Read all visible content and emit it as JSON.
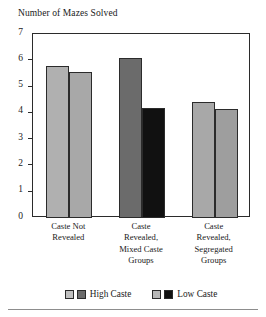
{
  "chart_data": {
    "type": "bar",
    "title": "Number of Mazes Solved",
    "xlabel": "",
    "ylabel": "",
    "ylim": [
      0,
      7
    ],
    "ytick_labels": [
      "7",
      "6",
      "5",
      "4",
      "3",
      "2",
      "1",
      "0"
    ],
    "ytick_values": [
      7,
      6,
      5,
      4,
      3,
      2,
      1,
      0
    ],
    "grid": false,
    "legend_position": "bottom",
    "categories": [
      "Caste Not Revealed",
      "Caste Revealed, Mixed Caste Groups",
      "Caste Revealed, Segregated Groups"
    ],
    "category_lines": [
      [
        "Caste Not",
        "Revealed"
      ],
      [
        "Caste",
        "Revealed,",
        "Mixed Caste",
        "Groups"
      ],
      [
        "Caste",
        "Revealed,",
        "Segregated",
        "Groups"
      ]
    ],
    "series": [
      {
        "name": "High Caste",
        "values": [
          5.8,
          6.1,
          4.4
        ],
        "colors": [
          "#b0b0b0",
          "#6b6b6b",
          "#a8a8a8"
        ]
      },
      {
        "name": "Low Caste",
        "values": [
          5.55,
          4.2,
          4.15
        ],
        "colors": [
          "#a8a8a8",
          "#111111",
          "#9e9e9e"
        ]
      }
    ],
    "legend": [
      {
        "label": "High Caste",
        "swatches": [
          "#c0c0c0",
          "#6b6b6b"
        ]
      },
      {
        "label": "Low Caste",
        "swatches": [
          "#b8b8b8",
          "#111111"
        ]
      }
    ]
  }
}
